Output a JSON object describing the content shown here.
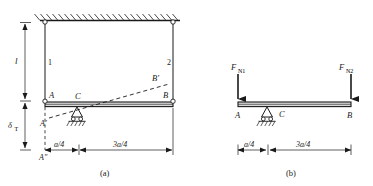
{
  "figure": {
    "kind": "structural-mechanics-diagram",
    "panels": [
      {
        "id": "a",
        "caption": "(a)",
        "description": "Rigid bar AB hung by two vertical rods from a fixed ceiling, with roller support at C and thermal displacement",
        "labels": {
          "rod1": "1",
          "rod2": "2",
          "length": "l",
          "delta": "δ",
          "delta_sub": "T",
          "point_A": "A",
          "point_B": "B",
          "point_C": "C",
          "point_A_prime": "A′",
          "point_A_double_prime": "A″",
          "point_B_prime": "B′"
        },
        "dimensions": [
          {
            "name": "left-span",
            "text": "a/4"
          },
          {
            "name": "right-span",
            "text": "3a/4"
          }
        ]
      },
      {
        "id": "b",
        "caption": "(b)",
        "description": "Free body diagram of bar AB with axial rod forces applied downward at A and B",
        "labels": {
          "force_left": "F",
          "force_left_sub": "N1",
          "force_right": "F",
          "force_right_sub": "N2",
          "point_A": "A",
          "point_B": "B",
          "point_C": "C"
        },
        "dimensions": [
          {
            "name": "left-span",
            "text": "a/4"
          },
          {
            "name": "right-span",
            "text": "3a/4"
          }
        ]
      }
    ],
    "colors": {
      "line": "#1a1a1a",
      "background": "#ffffff",
      "bar_fill": "#d9d9d9"
    }
  }
}
